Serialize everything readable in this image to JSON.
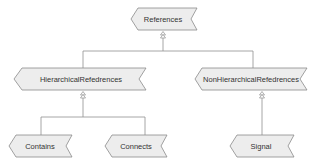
{
  "diagram": {
    "type": "inheritance-hierarchy",
    "colors": {
      "node_fill": "#ededed",
      "node_stroke": "#8a8a8a",
      "text": "#333333",
      "connector": "#8f8f8f"
    },
    "nodes": {
      "references": {
        "label": "References"
      },
      "hierarchical": {
        "label": "HierarchicalRefedrences"
      },
      "non_hierarchical": {
        "label": "NonHierarchicalRefedrences"
      },
      "contains": {
        "label": "Contains"
      },
      "connects": {
        "label": "Connects"
      },
      "signal": {
        "label": "Signal"
      }
    },
    "edges": [
      {
        "from": "HierarchicalRefedrences",
        "to": "References",
        "kind": "generalization"
      },
      {
        "from": "NonHierarchicalRefedrences",
        "to": "References",
        "kind": "generalization"
      },
      {
        "from": "Contains",
        "to": "HierarchicalRefedrences",
        "kind": "generalization"
      },
      {
        "from": "Connects",
        "to": "HierarchicalRefedrences",
        "kind": "generalization"
      },
      {
        "from": "Signal",
        "to": "NonHierarchicalRefedrences",
        "kind": "generalization"
      }
    ]
  }
}
